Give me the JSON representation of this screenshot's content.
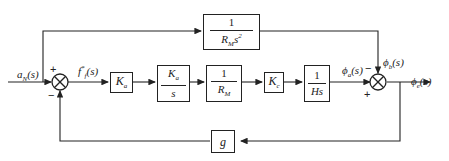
{
  "diagram": {
    "type": "control-system-block-diagram",
    "input": {
      "label": "a",
      "sub": "N",
      "arg": "(s)"
    },
    "sum1_output": {
      "label": "f",
      "sup": "*",
      "sub": "f",
      "arg": "(s)"
    },
    "sum1_signs": {
      "plus": "+",
      "minus": "−"
    },
    "sum2_signs": {
      "plus": "+",
      "minus": "−"
    },
    "blocks": {
      "feedforward": {
        "num": "1",
        "den_main": "R",
        "den_sub": "M",
        "den_tail": "s",
        "den_sup": "2"
      },
      "k1": {
        "main": "K",
        "sub": "a"
      },
      "k2": {
        "num_main": "K",
        "num_sub": "a",
        "den": "s"
      },
      "r": {
        "num": "1",
        "den_main": "R",
        "den_sub": "M"
      },
      "k3": {
        "main": "K",
        "sub": "c"
      },
      "h": {
        "num": "1",
        "den": "Hs"
      },
      "feedback": {
        "main": "g"
      }
    },
    "signals": {
      "phi_a": {
        "label": "ϕ",
        "sub": "a",
        "arg": "(s)"
      },
      "phi_b": {
        "label": "ϕ",
        "sub": "b",
        "arg": "(s)"
      },
      "output": {
        "label": "ϕ",
        "sub": "e",
        "arg": "(s)"
      }
    }
  }
}
